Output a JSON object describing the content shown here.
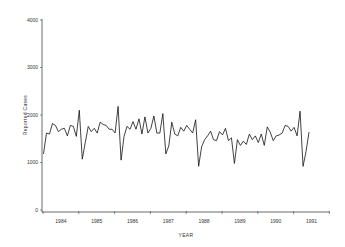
{
  "chart_data": {
    "type": "line",
    "title": "",
    "xlabel": "YEAR",
    "ylabel": "Reported Cases",
    "ylim": [
      0,
      4000
    ],
    "yticks": [
      0,
      1000,
      2000,
      3000,
      4000
    ],
    "xtick_labels": [
      "1984",
      "1985",
      "1986",
      "1987",
      "1988",
      "1989",
      "1990",
      "1991"
    ],
    "grid": false,
    "legend": null,
    "series": [
      {
        "name": "Reported Cases",
        "frequency": "monthly",
        "start": "1984-01",
        "values": [
          1180,
          1620,
          1600,
          1820,
          1780,
          1650,
          1700,
          1720,
          1560,
          1780,
          1760,
          1550,
          2100,
          1070,
          1420,
          1760,
          1650,
          1720,
          1620,
          1850,
          1800,
          1780,
          1700,
          1700,
          1620,
          2180,
          1050,
          1550,
          1760,
          1700,
          1860,
          1700,
          1920,
          1600,
          1960,
          1620,
          1720,
          1980,
          1620,
          1620,
          2030,
          1180,
          1350,
          1850,
          1600,
          1560,
          1740,
          1660,
          1780,
          1700,
          1620,
          1900,
          920,
          1330,
          1480,
          1560,
          1660,
          1480,
          1460,
          1650,
          1580,
          1720,
          1460,
          1520,
          980,
          1480,
          1360,
          1450,
          1380,
          1600,
          1480,
          1560,
          1420,
          1600,
          1360,
          1750,
          1640,
          1460,
          1560,
          1580,
          1620,
          1780,
          1760,
          1660,
          1740,
          1560,
          2080,
          920,
          1230,
          1640
        ]
      }
    ]
  },
  "axes": {
    "y_label": "Reported Cases",
    "x_label": "YEAR"
  }
}
